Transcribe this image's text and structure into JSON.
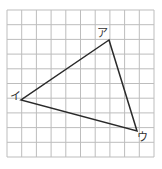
{
  "figure": {
    "grid": {
      "cols": 10,
      "rows": 10,
      "line_color": "#bdbdbd"
    },
    "triangle": {
      "stroke": "#2a2a2a",
      "vertices": [
        {
          "label": "ア",
          "x": 109,
          "y": 40
        },
        {
          "label": "イ",
          "x": 21,
          "y": 100
        },
        {
          "label": "ウ",
          "x": 137,
          "y": 131
        }
      ]
    }
  }
}
